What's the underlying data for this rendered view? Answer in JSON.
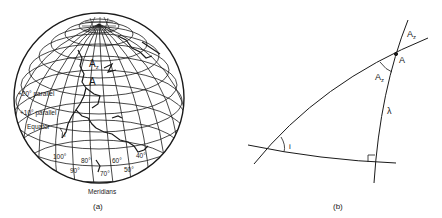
{
  "figure_a": {
    "caption": "(a)",
    "axis_label": "Meridians",
    "labels": {
      "parallel_20": "+20° parallel",
      "parallel_10": "+10° parallel",
      "equator": "Equator",
      "point_a": "A",
      "azimuth": "A",
      "azimuth_sub": "z",
      "inclination": "i"
    },
    "meridians": [
      "100°",
      "90°",
      "80°",
      "70°",
      "60°",
      "50°",
      "40°"
    ]
  },
  "figure_b": {
    "caption": "(b)",
    "labels": {
      "point_a": "A",
      "azimuth_top": "A",
      "azimuth_top_sub": "z",
      "azimuth_inner": "A",
      "azimuth_inner_sub": "z",
      "lambda": "λ",
      "inclination": "i"
    }
  },
  "colors": {
    "ink": "#1a1a1a",
    "background": "#ffffff"
  }
}
